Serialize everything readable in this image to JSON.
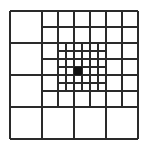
{
  "diagram": {
    "colors": {
      "background": "#ffffff",
      "line": "#2a2a2a",
      "target": "#111111"
    },
    "levels": [
      {
        "name": "level-1",
        "cell_size": 32,
        "region": {
          "x0": 10,
          "y0": 11,
          "x1": 138,
          "y1": 139
        }
      },
      {
        "name": "level-2",
        "cell_size": 16,
        "region": {
          "x0": 42,
          "y0": 11,
          "x1": 138,
          "y1": 107
        }
      },
      {
        "name": "level-3",
        "cell_size": 8,
        "region": {
          "x0": 58,
          "y0": 43,
          "x1": 106,
          "y1": 91
        }
      }
    ],
    "target_cell": {
      "x": 74,
      "y": 67,
      "size": 8
    }
  }
}
